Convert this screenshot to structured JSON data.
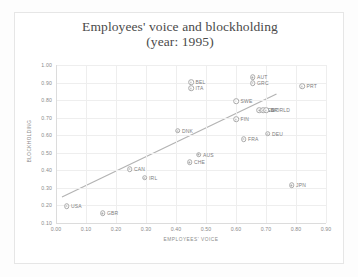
{
  "chart_data": {
    "type": "scatter",
    "title_line1": "Employees' voice and blockholding",
    "title_line2": "(year: 1995)",
    "xlabel": "EMPLOYEES' VOICE",
    "ylabel": "BLOCKHOLDING",
    "xlim": [
      0.0,
      0.9
    ],
    "ylim": [
      0.1,
      1.0
    ],
    "xticks": [
      "0.00",
      "0.10",
      "0.20",
      "0.30",
      "0.40",
      "0.50",
      "0.60",
      "0.70",
      "0.80",
      "0.90"
    ],
    "yticks": [
      "0.10",
      "0.20",
      "0.30",
      "0.40",
      "0.50",
      "0.60",
      "0.70",
      "0.80",
      "0.90",
      "1.00"
    ],
    "grid": true,
    "legend": "none",
    "marker_color": "#a9a9a9",
    "trendline_color": "#b3b3b3",
    "trendline": {
      "x0": 0.02,
      "y0": 0.248,
      "x1": 0.735,
      "y1": 0.835
    },
    "points": [
      {
        "label": "USA",
        "x": 0.035,
        "y": 0.197
      },
      {
        "label": "GBR",
        "x": 0.155,
        "y": 0.155
      },
      {
        "label": "CAN",
        "x": 0.245,
        "y": 0.408
      },
      {
        "label": "IRL",
        "x": 0.295,
        "y": 0.358
      },
      {
        "label": "CHE",
        "x": 0.445,
        "y": 0.445
      },
      {
        "label": "AUS",
        "x": 0.475,
        "y": 0.49
      },
      {
        "label": "DNK",
        "x": 0.405,
        "y": 0.625
      },
      {
        "label": "BEL",
        "x": 0.45,
        "y": 0.902
      },
      {
        "label": "ITA",
        "x": 0.45,
        "y": 0.868
      },
      {
        "label": "SWE",
        "x": 0.6,
        "y": 0.795
      },
      {
        "label": "FIN",
        "x": 0.6,
        "y": 0.69
      },
      {
        "label": "NLD",
        "x": 0.678,
        "y": 0.742
      },
      {
        "label": "ESP",
        "x": 0.69,
        "y": 0.742
      },
      {
        "label": "WORLD",
        "x": 0.7,
        "y": 0.742
      },
      {
        "label": "FRA",
        "x": 0.625,
        "y": 0.578
      },
      {
        "label": "DEU",
        "x": 0.705,
        "y": 0.608
      },
      {
        "label": "AUT",
        "x": 0.655,
        "y": 0.93
      },
      {
        "label": "GRC",
        "x": 0.655,
        "y": 0.898
      },
      {
        "label": "PRT",
        "x": 0.82,
        "y": 0.878
      },
      {
        "label": "JPN",
        "x": 0.785,
        "y": 0.315
      }
    ]
  }
}
